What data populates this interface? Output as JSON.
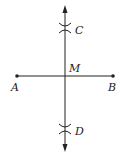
{
  "diagram": {
    "points": {
      "A": {
        "label": "A"
      },
      "B": {
        "label": "B"
      },
      "C": {
        "label": "C"
      },
      "D": {
        "label": "D"
      },
      "M": {
        "label": "M"
      }
    },
    "colors": {
      "stroke": "#222222",
      "background": "#ffffff"
    }
  }
}
